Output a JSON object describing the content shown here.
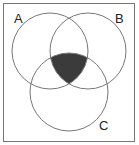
{
  "diagram": {
    "type": "venn",
    "sets": [
      {
        "label": "A",
        "cx": 50,
        "cy": 51,
        "r": 38
      },
      {
        "label": "B",
        "cx": 88,
        "cy": 51,
        "r": 38
      },
      {
        "label": "C",
        "cx": 69,
        "cy": 92,
        "r": 39
      }
    ],
    "shaded_region": "A ∩ B ∩ C",
    "colors": {
      "outline": "#777777",
      "box": "#777777",
      "shade": "#3b3b3b",
      "background": "#ffffff"
    }
  },
  "labels": {
    "a": "A",
    "b": "B",
    "c": "C"
  }
}
